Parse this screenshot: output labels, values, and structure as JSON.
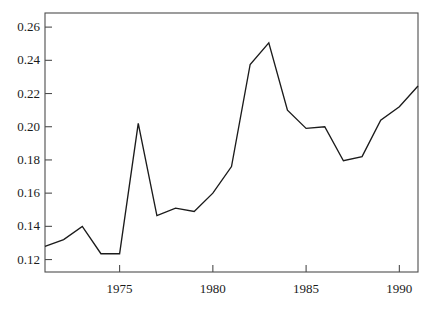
{
  "chart_data": {
    "type": "line",
    "title": "",
    "subtitle": "",
    "xlabel": "",
    "ylabel": "",
    "xlim": [
      1971,
      1991
    ],
    "ylim": [
      0.1125,
      0.2685
    ],
    "grid": false,
    "legend": null,
    "x": [
      1971,
      1972,
      1973,
      1974,
      1975,
      1976,
      1977,
      1978,
      1979,
      1980,
      1981,
      1982,
      1983,
      1984,
      1985,
      1986,
      1987,
      1988,
      1989,
      1990,
      1991
    ],
    "series": [
      {
        "name": "series-1",
        "color": "#1b1b1b",
        "values": [
          0.128,
          0.132,
          0.14,
          0.1235,
          0.1235,
          0.202,
          0.1465,
          0.151,
          0.149,
          0.16,
          0.176,
          0.2375,
          0.2505,
          0.21,
          0.199,
          0.2,
          0.1795,
          0.182,
          0.204,
          0.212,
          0.2245
        ]
      }
    ],
    "x_ticks": [
      1975,
      1980,
      1985,
      1990
    ],
    "x_tick_labels": [
      "1975",
      "1980",
      "1985",
      "1990"
    ],
    "x_minor_ticks": [],
    "y_ticks": [
      0.12,
      0.14,
      0.16,
      0.18,
      0.2,
      0.22,
      0.24,
      0.26
    ],
    "y_tick_labels": [
      "0.12",
      "0.14",
      "0.16",
      "0.18",
      "0.20",
      "0.22",
      "0.24",
      "0.26"
    ],
    "annotations": []
  },
  "axes": {
    "frame_color": "#4d4d4d",
    "tick_color": "#4d4d4d",
    "label_color": "#1b1b1b",
    "background": "#ffffff"
  }
}
